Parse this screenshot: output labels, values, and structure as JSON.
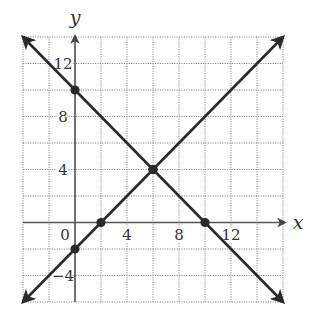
{
  "chart_data": {
    "type": "line",
    "title": "",
    "xlabel": "x",
    "ylabel": "y",
    "xlim": [
      -4,
      16
    ],
    "ylim": [
      -6,
      14
    ],
    "grid": true,
    "grid_step": 2,
    "x_ticks": [
      {
        "value": 0,
        "label": "0"
      },
      {
        "value": 4,
        "label": "4"
      },
      {
        "value": 8,
        "label": "8"
      },
      {
        "value": 12,
        "label": "12"
      }
    ],
    "y_ticks": [
      {
        "value": -4,
        "label": "−4"
      },
      {
        "value": 4,
        "label": "4"
      },
      {
        "value": 8,
        "label": "8"
      },
      {
        "value": 12,
        "label": "12"
      }
    ],
    "series": [
      {
        "name": "line_increasing",
        "equation": "y = x - 2",
        "slope": 1,
        "intercept": -2,
        "x": [
          -4,
          16
        ],
        "y": [
          -6,
          14
        ],
        "marked_points": [
          [
            0,
            -2
          ],
          [
            2,
            0
          ],
          [
            6,
            4
          ]
        ],
        "arrows": "both"
      },
      {
        "name": "line_decreasing",
        "equation": "y = -x + 10",
        "slope": -1,
        "intercept": 10,
        "x": [
          -4,
          16
        ],
        "y": [
          14,
          -6
        ],
        "marked_points": [
          [
            0,
            10
          ],
          [
            6,
            4
          ],
          [
            10,
            0
          ]
        ],
        "arrows": "both"
      }
    ],
    "intersection": [
      6,
      4
    ],
    "colors": {
      "lines": "#2a2a2a",
      "axes": "#555555",
      "grid": "#8a8a8a",
      "text": "#333333"
    }
  }
}
